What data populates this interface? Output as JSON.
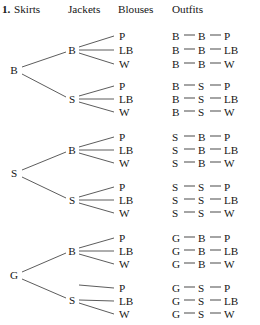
{
  "header": {
    "item_number": "1.",
    "columns": [
      "Skirts",
      "Jackets",
      "Blouses",
      "Outfits"
    ]
  },
  "legend": {
    "skirts": [
      "B",
      "S",
      "G"
    ],
    "jackets": [
      "B",
      "S"
    ],
    "blouses": [
      "P",
      "LB",
      "W"
    ]
  },
  "tree": {
    "skirt_nodes": [
      {
        "label": "B",
        "x": 14,
        "y": 70
      },
      {
        "label": "S",
        "x": 14,
        "y": 173
      },
      {
        "label": "G",
        "x": 14,
        "y": 275
      }
    ],
    "jacket_nodes": [
      {
        "label": "B",
        "x": 72,
        "y": 50
      },
      {
        "label": "S",
        "x": 72,
        "y": 99
      },
      {
        "label": "B",
        "x": 72,
        "y": 150
      },
      {
        "label": "S",
        "x": 72,
        "y": 200
      },
      {
        "label": "B",
        "x": 72,
        "y": 251
      },
      {
        "label": "S",
        "x": 72,
        "y": 300
      }
    ],
    "blouse_nodes": [
      {
        "label": "P",
        "x": 119,
        "y": 36
      },
      {
        "label": "LB",
        "x": 119,
        "y": 50
      },
      {
        "label": "W",
        "x": 119,
        "y": 64
      },
      {
        "label": "P",
        "x": 119,
        "y": 86
      },
      {
        "label": "LB",
        "x": 119,
        "y": 99
      },
      {
        "label": "W",
        "x": 119,
        "y": 112
      },
      {
        "label": "P",
        "x": 119,
        "y": 137
      },
      {
        "label": "LB",
        "x": 119,
        "y": 150
      },
      {
        "label": "W",
        "x": 119,
        "y": 163
      },
      {
        "label": "P",
        "x": 119,
        "y": 187
      },
      {
        "label": "LB",
        "x": 119,
        "y": 200
      },
      {
        "label": "W",
        "x": 119,
        "y": 213
      },
      {
        "label": "P",
        "x": 119,
        "y": 238
      },
      {
        "label": "LB",
        "x": 119,
        "y": 251
      },
      {
        "label": "W",
        "x": 119,
        "y": 264
      },
      {
        "label": "P",
        "x": 119,
        "y": 288
      },
      {
        "label": "LB",
        "x": 119,
        "y": 301
      },
      {
        "label": "W",
        "x": 119,
        "y": 314
      }
    ]
  },
  "outfits": [
    {
      "skirt": "B",
      "jacket": "B",
      "blouse": "P",
      "y": 36
    },
    {
      "skirt": "B",
      "jacket": "B",
      "blouse": "LB",
      "y": 50
    },
    {
      "skirt": "B",
      "jacket": "B",
      "blouse": "W",
      "y": 64
    },
    {
      "skirt": "B",
      "jacket": "S",
      "blouse": "P",
      "y": 86
    },
    {
      "skirt": "B",
      "jacket": "S",
      "blouse": "LB",
      "y": 99
    },
    {
      "skirt": "B",
      "jacket": "S",
      "blouse": "W",
      "y": 112
    },
    {
      "skirt": "S",
      "jacket": "B",
      "blouse": "P",
      "y": 137
    },
    {
      "skirt": "S",
      "jacket": "B",
      "blouse": "LB",
      "y": 150
    },
    {
      "skirt": "S",
      "jacket": "B",
      "blouse": "W",
      "y": 163
    },
    {
      "skirt": "S",
      "jacket": "S",
      "blouse": "P",
      "y": 187
    },
    {
      "skirt": "S",
      "jacket": "S",
      "blouse": "LB",
      "y": 200
    },
    {
      "skirt": "S",
      "jacket": "S",
      "blouse": "W",
      "y": 213
    },
    {
      "skirt": "G",
      "jacket": "B",
      "blouse": "P",
      "y": 238
    },
    {
      "skirt": "G",
      "jacket": "B",
      "blouse": "LB",
      "y": 251
    },
    {
      "skirt": "G",
      "jacket": "B",
      "blouse": "W",
      "y": 264
    },
    {
      "skirt": "G",
      "jacket": "S",
      "blouse": "P",
      "y": 288
    },
    {
      "skirt": "G",
      "jacket": "S",
      "blouse": "LB",
      "y": 301
    },
    {
      "skirt": "G",
      "jacket": "S",
      "blouse": "W",
      "y": 314
    }
  ],
  "edges": [
    {
      "x1": 22,
      "y1": 67,
      "x2": 66,
      "y2": 52
    },
    {
      "x1": 22,
      "y1": 74,
      "x2": 66,
      "y2": 97
    },
    {
      "x1": 79,
      "y1": 47,
      "x2": 114,
      "y2": 36
    },
    {
      "x1": 79,
      "y1": 50,
      "x2": 114,
      "y2": 50
    },
    {
      "x1": 79,
      "y1": 53,
      "x2": 114,
      "y2": 64
    },
    {
      "x1": 79,
      "y1": 96,
      "x2": 114,
      "y2": 86
    },
    {
      "x1": 79,
      "y1": 99,
      "x2": 114,
      "y2": 99
    },
    {
      "x1": 79,
      "y1": 102,
      "x2": 114,
      "y2": 112
    },
    {
      "x1": 22,
      "y1": 170,
      "x2": 66,
      "y2": 152
    },
    {
      "x1": 22,
      "y1": 177,
      "x2": 66,
      "y2": 198
    },
    {
      "x1": 79,
      "y1": 147,
      "x2": 114,
      "y2": 137
    },
    {
      "x1": 79,
      "y1": 150,
      "x2": 114,
      "y2": 150
    },
    {
      "x1": 79,
      "y1": 153,
      "x2": 114,
      "y2": 163
    },
    {
      "x1": 79,
      "y1": 197,
      "x2": 114,
      "y2": 187
    },
    {
      "x1": 79,
      "y1": 200,
      "x2": 114,
      "y2": 200
    },
    {
      "x1": 79,
      "y1": 203,
      "x2": 114,
      "y2": 213
    },
    {
      "x1": 22,
      "y1": 272,
      "x2": 66,
      "y2": 253
    },
    {
      "x1": 22,
      "y1": 279,
      "x2": 66,
      "y2": 298
    },
    {
      "x1": 79,
      "y1": 248,
      "x2": 114,
      "y2": 238
    },
    {
      "x1": 79,
      "y1": 251,
      "x2": 114,
      "y2": 251
    },
    {
      "x1": 79,
      "y1": 254,
      "x2": 114,
      "y2": 264
    },
    {
      "x1": 79,
      "y1": 285,
      "x2": 114,
      "y2": 288
    },
    {
      "x1": 79,
      "y1": 300,
      "x2": 114,
      "y2": 301
    },
    {
      "x1": 79,
      "y1": 303,
      "x2": 114,
      "y2": 314
    }
  ],
  "colors": {
    "ink": "#161616",
    "line": "#4a4a4a",
    "background": "#ffffff"
  }
}
